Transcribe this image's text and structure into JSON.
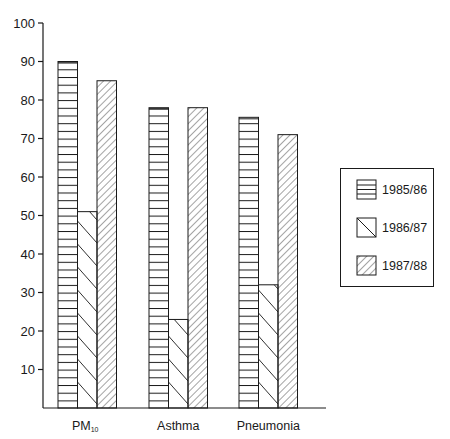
{
  "chart_data": {
    "type": "bar",
    "title": "",
    "xlabel": "",
    "ylabel": "",
    "ylim": [
      0,
      100
    ],
    "yticks": [
      10,
      20,
      30,
      40,
      50,
      60,
      70,
      80,
      90,
      100
    ],
    "grid": false,
    "legend_position": "right",
    "categories": [
      "PM10",
      "Asthma",
      "Pneumonia"
    ],
    "category_labels": [
      {
        "main": "PM",
        "sub": "10"
      },
      {
        "main": "Asthma",
        "sub": ""
      },
      {
        "main": "Pneumonia",
        "sub": ""
      }
    ],
    "series": [
      {
        "name": "1985/86",
        "pattern": "horizontal-lines",
        "values": [
          90,
          78,
          75.5
        ]
      },
      {
        "name": "1986/87",
        "pattern": "diagonal-chevron",
        "values": [
          51,
          23,
          32
        ]
      },
      {
        "name": "1987/88",
        "pattern": "diagonal-hatch",
        "values": [
          85,
          78,
          71
        ]
      }
    ]
  },
  "colors": {
    "ink": "#1a1a1a",
    "background": "#ffffff"
  }
}
